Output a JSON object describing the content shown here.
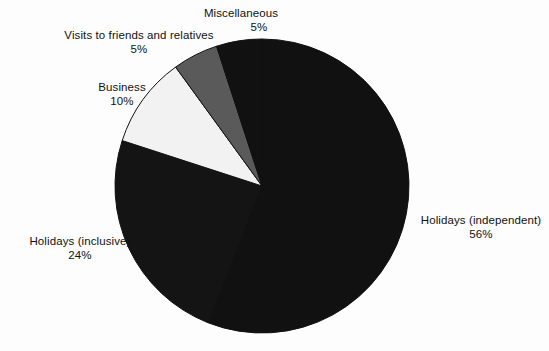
{
  "chart_data": {
    "type": "pie",
    "title": "",
    "subtitle": "",
    "xlabel": "",
    "ylabel": "",
    "legend_position": "none",
    "grid": false,
    "units": "percent",
    "start_angle_deg": 0,
    "direction": "clockwise",
    "center": {
      "x": 262,
      "y": 186
    },
    "radius": 147,
    "categories": [
      "Holidays (independent)",
      "Holidays (inclusive)",
      "Business",
      "Visits to friends and relatives",
      "Miscellaneous"
    ],
    "values": [
      56,
      24,
      10,
      5,
      5
    ],
    "slices": [
      {
        "label": "Holidays (independent)",
        "value": 56,
        "value_text": "56%",
        "color": "#111111",
        "start_deg": 0,
        "end_deg": 201.6
      },
      {
        "label": "Holidays (inclusive)",
        "value": 24,
        "value_text": "24%",
        "color": "#141414",
        "start_deg": 201.6,
        "end_deg": 288
      },
      {
        "label": "Business",
        "value": 10,
        "value_text": "10%",
        "color": "#f2f2f2",
        "start_deg": 288,
        "end_deg": 324
      },
      {
        "label": "Visits to friends and relatives",
        "value": 5,
        "value_text": "5%",
        "color": "#5a5a5a",
        "start_deg": 324,
        "end_deg": 342
      },
      {
        "label": "Miscellaneous",
        "value": 5,
        "value_text": "5%",
        "color": "#111111",
        "start_deg": 342,
        "end_deg": 360
      }
    ]
  },
  "labels": {
    "miscellaneous": {
      "name": "Miscellaneous",
      "value": "5%"
    },
    "visits": {
      "name": "Visits to friends and relatives",
      "value": "5%"
    },
    "business": {
      "name": "Business",
      "value": "10%"
    },
    "holidays_inclusive": {
      "name": "Holidays (inclusive)",
      "value": "24%"
    },
    "holidays_independent": {
      "name": "Holidays (independent)",
      "value": "56%"
    }
  },
  "colors": {
    "background": "#fdfdfd",
    "text": "#111111",
    "slice_black": "#111111",
    "slice_dark_black": "#141414",
    "slice_gray": "#5a5a5a",
    "slice_white": "#f2f2f2",
    "slice_outline": "#111111"
  }
}
